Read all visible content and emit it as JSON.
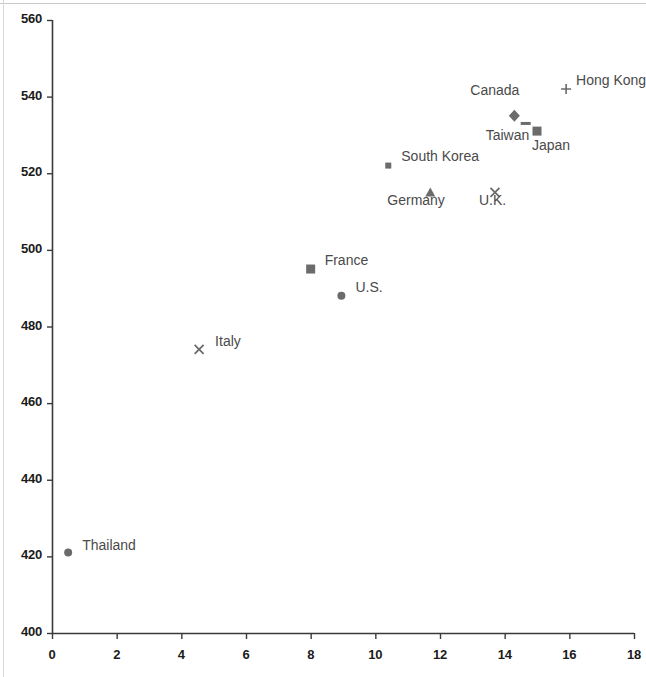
{
  "chart_data": {
    "type": "scatter",
    "title": "",
    "subtitle": "",
    "xlabel": "",
    "ylabel": "",
    "xlim": [
      0,
      18
    ],
    "ylim": [
      400,
      560
    ],
    "xticks": [
      "0",
      "2",
      "4",
      "6",
      "8",
      "10",
      "12",
      "14",
      "16",
      "18"
    ],
    "yticks": [
      "400",
      "420",
      "440",
      "460",
      "480",
      "500",
      "520",
      "540",
      "560"
    ],
    "grid": false,
    "legend": "none",
    "marker_color": "#6b6b6b",
    "axis_color": "#3a3a3a",
    "points": [
      {
        "label": "Thailand",
        "x": 0.5,
        "y": 421,
        "marker": "circle",
        "label_dx": 14,
        "label_dy": -8
      },
      {
        "label": "Italy",
        "x": 4.55,
        "y": 474,
        "marker": "x",
        "label_dx": 16,
        "label_dy": -8
      },
      {
        "label": "France",
        "x": 8.0,
        "y": 495,
        "marker": "square",
        "label_dx": 14,
        "label_dy": -9
      },
      {
        "label": "U.S.",
        "x": 8.95,
        "y": 488,
        "marker": "circle",
        "label_dx": 14,
        "label_dy": -9
      },
      {
        "label": "South Korea",
        "x": 10.4,
        "y": 522,
        "marker": "square-sm",
        "label_dx": 13,
        "label_dy": -10
      },
      {
        "label": "Germany",
        "x": 11.7,
        "y": 515,
        "marker": "triangle",
        "label_dx": -43,
        "label_dy": 8
      },
      {
        "label": "U.K.",
        "x": 13.7,
        "y": 515,
        "marker": "x",
        "label_dx": -16,
        "label_dy": 8
      },
      {
        "label": "Canada",
        "x": 14.3,
        "y": 535,
        "marker": "diamond",
        "label_dx": -44,
        "label_dy": -26
      },
      {
        "label": "Taiwan",
        "x": 14.65,
        "y": 533,
        "marker": "dash",
        "label_dx": -40,
        "label_dy": 12
      },
      {
        "label": "Japan",
        "x": 15.0,
        "y": 531,
        "marker": "square",
        "label_dx": -5,
        "label_dy": 14
      },
      {
        "label": "Hong Kong",
        "x": 15.9,
        "y": 542,
        "marker": "plus",
        "label_dx": 10,
        "label_dy": -9
      }
    ]
  },
  "axes": {
    "x_axis_name": "horizontal-axis",
    "y_axis_name": "vertical-axis"
  }
}
